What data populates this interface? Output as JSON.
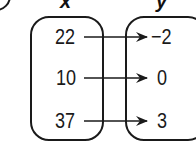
{
  "diagram": {
    "type": "mapping-diagram",
    "domain_label": "x",
    "range_label": "y",
    "domain": [
      "22",
      "10",
      "37"
    ],
    "range": [
      "−2",
      "0",
      "3"
    ],
    "mappings": [
      {
        "from": "22",
        "to": "−2"
      },
      {
        "from": "10",
        "to": "0"
      },
      {
        "from": "37",
        "to": "3"
      }
    ],
    "colors": {
      "stroke": "#1a1a1a",
      "background": "#ffffff"
    }
  }
}
